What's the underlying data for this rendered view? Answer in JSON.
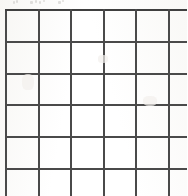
{
  "document": {
    "type": "scanned-worksheet",
    "title": "Blank grid worksheet",
    "caption": "",
    "background_color": "#fdfdfc",
    "paper_tint": "#f7f6f3"
  },
  "grid": {
    "name": "blank-grid",
    "rows_visible": 6,
    "columns_visible": 6,
    "last_column_clipped": true,
    "bottom_row_clipped": false,
    "line_color": "#4a4a4a",
    "line_width_px": 2,
    "cell_fill": "transparent",
    "origin": {
      "x": 5,
      "y": 9
    },
    "cell_width_px": 30.5,
    "cell_height_px": 29.8,
    "vertical_line_positions": [
      5,
      36,
      66,
      97,
      128,
      158,
      187
    ],
    "horizontal_line_positions": [
      9,
      38,
      68,
      97,
      127,
      157,
      188
    ],
    "cells": [
      [
        "",
        "",
        "",
        "",
        "",
        ""
      ],
      [
        "",
        "",
        "",
        "",
        "",
        ""
      ],
      [
        "",
        "",
        "",
        "",
        "",
        ""
      ],
      [
        "",
        "",
        "",
        "",
        "",
        ""
      ],
      [
        "",
        "",
        "",
        "",
        "",
        ""
      ],
      [
        "",
        "",
        "",
        "",
        "",
        ""
      ]
    ]
  },
  "artifacts": {
    "top_marks": [
      {
        "x": 13,
        "y": 1,
        "w": 2,
        "h": 3
      },
      {
        "x": 16,
        "y": 0,
        "w": 2,
        "h": 3
      },
      {
        "x": 30,
        "y": 1,
        "w": 3,
        "h": 3
      },
      {
        "x": 35,
        "y": 0,
        "w": 2,
        "h": 3
      },
      {
        "x": 39,
        "y": 1,
        "w": 2,
        "h": 3
      },
      {
        "x": 43,
        "y": 0,
        "w": 2,
        "h": 2
      },
      {
        "x": 58,
        "y": 1,
        "w": 3,
        "h": 3
      },
      {
        "x": 62,
        "y": 0,
        "w": 2,
        "h": 2
      }
    ],
    "smudges": [
      {
        "x": 22,
        "y": 74,
        "w": 12,
        "h": 16
      },
      {
        "x": 143,
        "y": 96,
        "w": 14,
        "h": 10
      },
      {
        "x": 98,
        "y": 55,
        "w": 10,
        "h": 8
      }
    ]
  }
}
